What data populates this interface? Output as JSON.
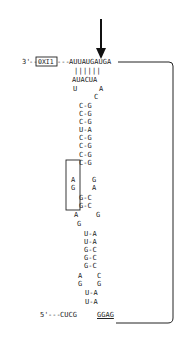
{
  "figure": {
    "arrow": {
      "label": "cleavage/start site arrow"
    },
    "top_strand": {
      "prime_label": "3'",
      "dash_left": "---",
      "boxed_label": "OXI1",
      "dash_right": "---",
      "sequence": "AUUAUGAUGA"
    },
    "pair_bars": "||||||",
    "pairing_strand": "AUACUA",
    "loop_top": {
      "left": "U",
      "right": "A",
      "bulge": "C"
    },
    "stem_upper": [
      {
        "left": "C",
        "right": "G"
      },
      {
        "left": "C",
        "right": "G"
      },
      {
        "left": "C",
        "right": "G"
      },
      {
        "left": "U",
        "right": "A"
      },
      {
        "left": "C",
        "right": "G"
      },
      {
        "left": "C",
        "right": "G"
      },
      {
        "left": "C",
        "right": "G"
      },
      {
        "left": "C",
        "right": "G"
      }
    ],
    "internal_loop_1": [
      {
        "left": "A",
        "right": "G"
      },
      {
        "left": "G",
        "right": "A"
      }
    ],
    "stem_middle": [
      {
        "left": "G",
        "right": "C"
      },
      {
        "left": "G",
        "right": "C"
      }
    ],
    "internal_loop_2": [
      {
        "left": "A",
        "right": "G"
      },
      {
        "left": "G",
        "right": ""
      }
    ],
    "stem_lower": [
      {
        "left": "U",
        "right": "A"
      },
      {
        "left": "U",
        "right": "A"
      },
      {
        "left": "G",
        "right": "C"
      },
      {
        "left": "G",
        "right": "C"
      },
      {
        "left": "G",
        "right": "C"
      }
    ],
    "internal_loop_3": [
      {
        "left": "A",
        "right": "C"
      },
      {
        "left": "G",
        "right": "G"
      }
    ],
    "stem_bottom": [
      {
        "left": "U",
        "right": "A"
      },
      {
        "left": "U",
        "right": "A"
      }
    ],
    "bottom_strand": {
      "prime_label": "5'",
      "dash": "---",
      "sequence_left": "CUCG",
      "sequence_right_underlined": "GGAG"
    },
    "pair_dash": "-"
  }
}
